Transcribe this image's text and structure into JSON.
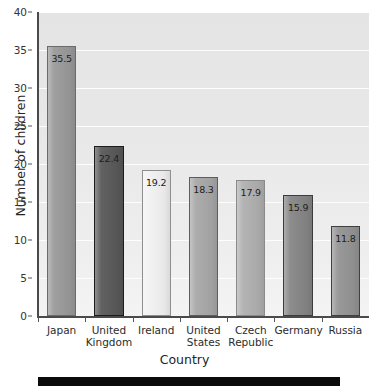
{
  "chart_data": {
    "type": "bar",
    "title": "",
    "subtitle": "",
    "xlabel": "Country",
    "ylabel": "Number of children",
    "categories": [
      "Japan",
      "United Kingdom",
      "Ireland",
      "United States",
      "Czech Republic",
      "Germany",
      "Russia"
    ],
    "category_lines": [
      [
        "Japan"
      ],
      [
        "United",
        "Kingdom"
      ],
      [
        "Ireland"
      ],
      [
        "United",
        "States"
      ],
      [
        "Czech",
        "Republic"
      ],
      [
        "Germany"
      ],
      [
        "Russia"
      ]
    ],
    "values": [
      35.5,
      22.4,
      19.2,
      18.3,
      17.9,
      15.9,
      11.8
    ],
    "value_labels": [
      "35.5",
      "22.4",
      "19.2",
      "18.3",
      "17.9",
      "15.9",
      "11.8"
    ],
    "bar_colors": [
      "#9a9a9a",
      "#595959",
      "#f2f2f2",
      "#a8a8a8",
      "#b0b0b0",
      "#868686",
      "#949494"
    ],
    "bar_edge_colors": [
      "#6b6b6b",
      "#1c1c1c",
      "#8f8f8f",
      "#5d5d5d",
      "#8a8a8a",
      "#3c3c3c",
      "#3f3f3f"
    ],
    "ylim": [
      0,
      40
    ],
    "yticks": [
      0,
      5,
      10,
      15,
      20,
      25,
      30,
      35,
      40
    ],
    "ytick_labels": [
      "0",
      "5",
      "10",
      "15",
      "20",
      "25",
      "30",
      "35",
      "40"
    ],
    "grid": true,
    "grid_axis": "y",
    "grid_color": "#fdfdfd",
    "legend": "none",
    "plot_background": "#e9e9e9",
    "figure_background": "#ffffff",
    "axis_color": "#4a4a4a",
    "text_color": "#2b2b2b"
  },
  "footer": {
    "rule_color": "#0b0b0b"
  }
}
